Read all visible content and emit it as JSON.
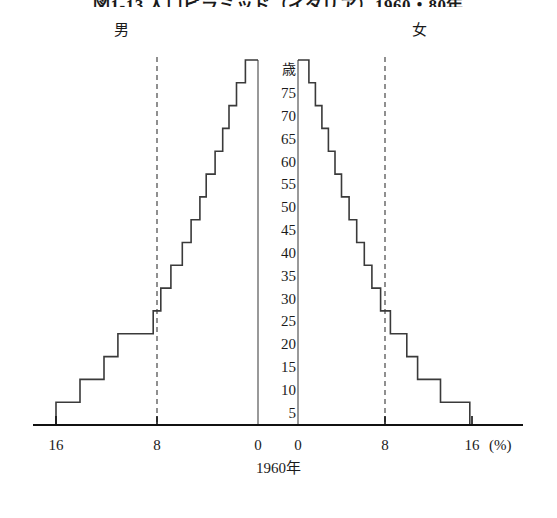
{
  "figure": {
    "title": "図1-13 人口ピラミッド（イタリア）1960・80年",
    "caption": "1960年",
    "unit_label": "(%)",
    "age_axis_unit": "歳"
  },
  "legend": {
    "male_label": "男",
    "female_label": "女"
  },
  "axis": {
    "x_ticks_left": [
      "16",
      "8",
      "0"
    ],
    "x_ticks_right": [
      "0",
      "8",
      "16"
    ],
    "age_ticks": [
      "歳",
      "75",
      "70",
      "65",
      "60",
      "55",
      "50",
      "45",
      "40",
      "35",
      "30",
      "25",
      "20",
      "15",
      "10",
      "5"
    ],
    "reference_line_value": 8,
    "x_max": 17.5
  },
  "colors": {
    "line": "#3a3a3a",
    "axis": "#111111",
    "dashed": "#555555",
    "background": "#ffffff"
  },
  "chart_data": {
    "type": "bar",
    "title": "図1-13 人口ピラミッド（イタリア）1960・80年",
    "subtitle": "1960年",
    "xlabel": "(%)",
    "ylabel": "歳",
    "orientation": "population-pyramid",
    "xlim": [
      0,
      17.5
    ],
    "grid": false,
    "legend_position": "top",
    "categories": [
      "5",
      "10",
      "15",
      "20",
      "25",
      "30",
      "35",
      "40",
      "45",
      "50",
      "55",
      "60",
      "65",
      "70",
      "75",
      "80+"
    ],
    "series": [
      {
        "name": "男",
        "side": "left",
        "values": [
          16.0,
          14.1,
          12.2,
          11.1,
          8.3,
          7.7,
          6.9,
          6.0,
          5.3,
          4.6,
          4.1,
          3.4,
          2.8,
          2.3,
          1.7,
          1.0
        ]
      },
      {
        "name": "女",
        "side": "right",
        "values": [
          15.8,
          13.1,
          11.0,
          10.0,
          8.5,
          7.6,
          6.8,
          6.1,
          5.4,
          4.7,
          4.0,
          3.4,
          2.8,
          2.2,
          1.6,
          1.0
        ]
      }
    ]
  }
}
